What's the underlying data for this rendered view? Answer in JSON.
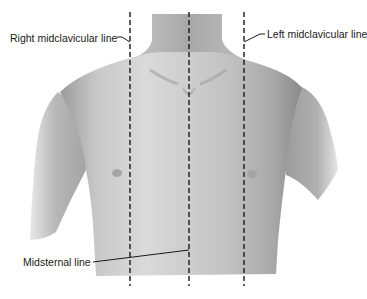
{
  "figure": {
    "labels": {
      "right_midclavicular": "Right midclavicular line",
      "left_midclavicular": "Left midclavicular line",
      "midsternal": "Midsternal line"
    },
    "lines": [
      {
        "name": "right-midclavicular-line",
        "x": 130
      },
      {
        "name": "midsternal-line",
        "x": 189
      },
      {
        "name": "left-midclavicular-line",
        "x": 244
      }
    ],
    "colors": {
      "background": "#ffffff",
      "skin_light": "#d9d9d9",
      "skin_mid": "#b5b5b5",
      "skin_dark": "#8c8c8c",
      "line": "#1a1a1a"
    }
  }
}
